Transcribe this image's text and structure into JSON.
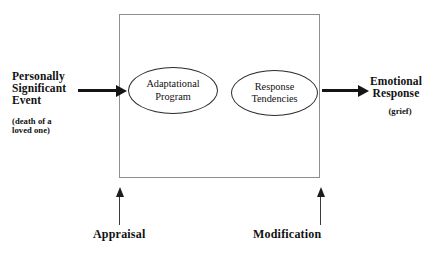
{
  "diagram": {
    "type": "process-flow",
    "container_box": {
      "label": ""
    },
    "input": {
      "lines": [
        "Personally",
        "Significant",
        "Event"
      ],
      "text": "Personally Significant Event",
      "sub_lines": [
        "(death of a",
        "loved one)"
      ],
      "sub_text": "(death of a loved one)"
    },
    "nodes": [
      {
        "id": "adaptational-program",
        "shape": "ellipse",
        "lines": [
          "Adaptational",
          "Program"
        ],
        "text": "Adaptational Program"
      },
      {
        "id": "response-tendencies",
        "shape": "ellipse",
        "lines": [
          "Response",
          "Tendencies"
        ],
        "text": "Response Tendencies"
      }
    ],
    "output": {
      "lines": [
        "Emotional",
        "Response"
      ],
      "text": "Emotional Response",
      "sub_text": "(grief)"
    },
    "modulators": [
      {
        "id": "appraisal",
        "label": "Appraisal"
      },
      {
        "id": "modification",
        "label": "Modification"
      }
    ],
    "colors": {
      "ink": "#121212",
      "box_border": "#8e8e8e",
      "ellipse_border": "#2b2b2b",
      "arrow": "#151515",
      "background": "#ffffff"
    }
  }
}
